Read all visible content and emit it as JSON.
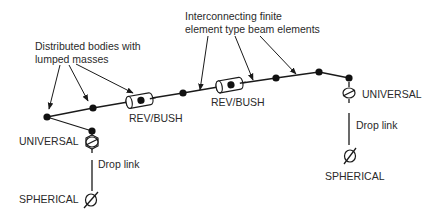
{
  "diagram": {
    "annotations": {
      "distributed_bodies_line1": "Distributed bodies with",
      "distributed_bodies_line2": "lumped masses",
      "beam_elements_line1": "Interconnecting finite",
      "beam_elements_line2": "element type beam elements"
    },
    "joints": {
      "rev_bush_1": "REV/BUSH",
      "rev_bush_2": "REV/BUSH",
      "universal_left": "UNIVERSAL",
      "universal_right": "UNIVERSAL",
      "spherical_left": "SPHERICAL",
      "spherical_right": "SPHERICAL"
    },
    "links": {
      "drop_link_left": "Drop link",
      "drop_link_right": "Drop link"
    },
    "colors": {
      "ink": "#1a1a1a",
      "text": "#2a2a2a",
      "background": "#ffffff"
    }
  }
}
